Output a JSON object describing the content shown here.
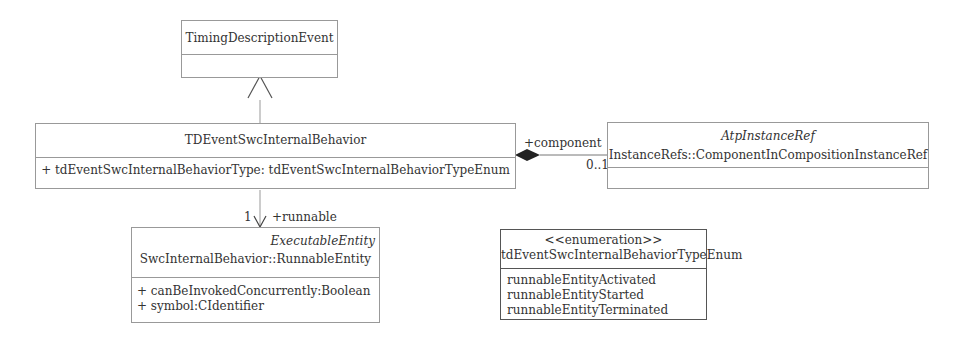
{
  "diagram": {
    "classes": {
      "timing_description_event": {
        "name": "TimingDescriptionEvent"
      },
      "td_event_swc_internal_behavior": {
        "name": "TDEventSwcInternalBehavior",
        "attributes": [
          "+ tdEventSwcInternalBehaviorType: tdEventSwcInternalBehaviorTypeEnum"
        ]
      },
      "atp_instance_ref": {
        "stereotype_italic": "AtpInstanceRef",
        "name": "InstanceRefs::ComponentInCompositionInstanceRef"
      },
      "runnable_entity": {
        "stereotype_italic": "ExecutableEntity",
        "name": "SwcInternalBehavior::RunnableEntity",
        "attributes": [
          "+ canBeInvokedConcurrently:Boolean",
          "+ symbol:CIdentifier"
        ]
      },
      "type_enum": {
        "stereotype": "<<enumeration>>",
        "name": "tdEventSwcInternalBehaviorTypeEnum",
        "literals": [
          "runnableEntityActivated",
          "runnableEntityStarted",
          "runnableEntityTerminated"
        ]
      }
    },
    "relations": {
      "generalization": {
        "from": "TDEventSwcInternalBehavior",
        "to": "TimingDescriptionEvent"
      },
      "composition": {
        "role": "+component",
        "multiplicity": "0..1"
      },
      "association": {
        "role": "+runnable",
        "multiplicity": "1"
      }
    },
    "colors": {
      "line": "#999999",
      "dark_line": "#555555",
      "text": "#333333"
    }
  }
}
